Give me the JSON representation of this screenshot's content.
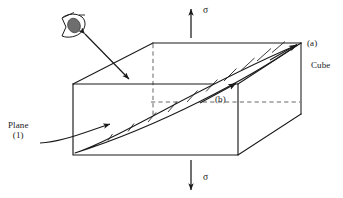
{
  "figure": {
    "labels": {
      "plane_line1": "Plane",
      "plane_line2": "(1)",
      "corner_a": "(a)",
      "cube": "Cube",
      "point_b": "(b)",
      "sigma_top": "σ",
      "sigma_bottom": "σ"
    },
    "colors": {
      "stroke": "#1a1a1a",
      "background": "#ffffff",
      "pupil_fill": "#6e6e6e",
      "hatch": "#1a1a1a"
    },
    "icons": {
      "eye": "eye-icon",
      "view_direction": "double-arrow-icon",
      "plane_pointer": "curved-arrow-icon",
      "stress_top": "arrow-up-icon",
      "stress_bottom": "arrow-down-icon"
    },
    "geometry": {
      "cube_front_face": [
        [
          73,
          84
        ],
        [
          238,
          84
        ],
        [
          238,
          155
        ],
        [
          73,
          155
        ]
      ],
      "cube_top_back_left": [
        153,
        43
      ],
      "cube_top_back_right": [
        301,
        43
      ],
      "cube_right_back_bottom": [
        301,
        114
      ],
      "hidden_vertical_dashed": [
        [
          153,
          43
        ],
        [
          153,
          114
        ]
      ],
      "hidden_horizontal_dashed": [
        [
          153,
          102
        ],
        [
          301,
          102
        ]
      ],
      "plane_tip_front": [
        75,
        153
      ],
      "plane_tip_back": [
        299,
        45
      ],
      "hatch_count": 11
    }
  }
}
